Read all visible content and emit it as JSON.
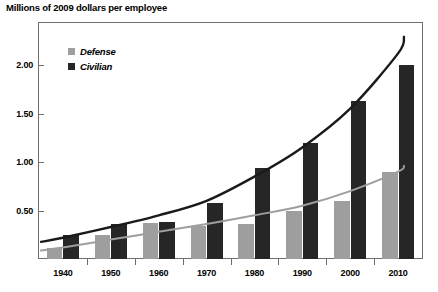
{
  "chart_data": {
    "type": "bar",
    "title": "Millions of 2009 dollars per employee",
    "xlabel": "",
    "ylabel": "",
    "categories": [
      "1940",
      "1950",
      "1960",
      "1970",
      "1980",
      "1990",
      "2000",
      "2010"
    ],
    "series": [
      {
        "name": "Defense",
        "color": "#9e9e9e",
        "values": [
          0.11,
          0.25,
          0.37,
          0.34,
          0.36,
          0.49,
          0.6,
          0.9
        ]
      },
      {
        "name": "Civilian",
        "color": "#262626",
        "values": [
          0.25,
          0.36,
          0.38,
          0.58,
          0.94,
          1.2,
          1.63,
          2.0
        ]
      }
    ],
    "trend_lines": [
      {
        "name": "Defense trend",
        "color": "#9e9e9e",
        "values": [
          0.12,
          0.2,
          0.28,
          0.36,
          0.45,
          0.55,
          0.7,
          0.9
        ]
      },
      {
        "name": "Civilian trend",
        "color": "#1a1a1a",
        "values": [
          0.22,
          0.33,
          0.45,
          0.6,
          0.85,
          1.15,
          1.55,
          2.12
        ]
      }
    ],
    "ylim": [
      0,
      2.25
    ],
    "yticks": [
      "0.50",
      "1.00",
      "1.50",
      "2.00"
    ],
    "ytick_values": [
      0.5,
      1.0,
      1.5,
      2.0
    ],
    "grid": false,
    "legend_position": "top-left",
    "legend": [
      "Defense",
      "Civilian"
    ]
  },
  "axis": {
    "y_labels": [
      "2.00",
      "1.50",
      "1.00",
      "0.50"
    ],
    "x_labels": [
      "1940",
      "1950",
      "1960",
      "1970",
      "1980",
      "1990",
      "2000",
      "2010"
    ]
  },
  "legend": {
    "items": [
      {
        "label": "Defense",
        "swatch": "gray-square-icon"
      },
      {
        "label": "Civilian",
        "swatch": "black-square-icon"
      }
    ]
  }
}
